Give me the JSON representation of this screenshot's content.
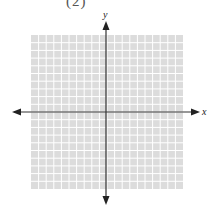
{
  "problem_label": "(2)",
  "axes": {
    "x_label": "x",
    "y_label": "y"
  },
  "grid": {
    "columns": 20,
    "rows": 20,
    "fill_color": "#dcdcdc",
    "line_color": "#ffffff"
  },
  "colors": {
    "axis": "#333333"
  }
}
